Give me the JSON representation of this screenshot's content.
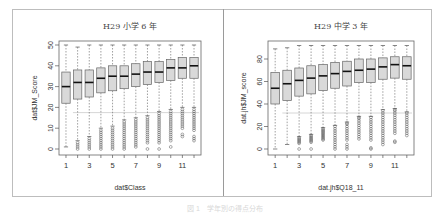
{
  "caption": "図 1　学年別の得点分布",
  "chart_data": [
    {
      "type": "boxplot",
      "title": "H29 小学 6 年",
      "xlabel": "dat$Class",
      "ylabel": "dat$JM_Score",
      "ylim": [
        0,
        50
      ],
      "yticks": [
        0,
        10,
        20,
        30,
        40,
        50
      ],
      "categories": [
        "1",
        "2",
        "3",
        "4",
        "5",
        "6",
        "7",
        "8",
        "9",
        "10",
        "11",
        "12"
      ],
      "xtick_labels": [
        "1",
        "3",
        "5",
        "7",
        "9",
        "11"
      ],
      "reference_line": 17.5,
      "boxes": [
        {
          "whislo": 1,
          "q1": 22,
          "med": 30,
          "q3": 37,
          "whishi": 50,
          "outliers": []
        },
        {
          "whislo": 4,
          "q1": 24,
          "med": 32,
          "q3": 38,
          "whishi": 49,
          "outliers": [
            0,
            1,
            2,
            3
          ]
        },
        {
          "whislo": 6,
          "q1": 25,
          "med": 32,
          "q3": 38,
          "whishi": 50,
          "outliers": [
            0,
            1,
            2,
            3,
            4,
            5
          ]
        },
        {
          "whislo": 10,
          "q1": 27,
          "med": 34,
          "q3": 39,
          "whishi": 50,
          "outliers": [
            0,
            1,
            2,
            3,
            4,
            5,
            6,
            7,
            8,
            9
          ]
        },
        {
          "whislo": 11,
          "q1": 28,
          "med": 35,
          "q3": 40,
          "whishi": 50,
          "outliers": [
            0,
            1,
            2,
            3,
            4,
            5,
            6,
            7,
            8,
            9,
            10
          ]
        },
        {
          "whislo": 14,
          "q1": 29,
          "med": 35,
          "q3": 40,
          "whishi": 50,
          "outliers": [
            0,
            1,
            2,
            3,
            4,
            5,
            6,
            7,
            8,
            9,
            10,
            11,
            12,
            13
          ]
        },
        {
          "whislo": 15,
          "q1": 30,
          "med": 36,
          "q3": 41,
          "whishi": 50,
          "outliers": [
            1,
            2,
            3,
            4,
            5,
            6,
            7,
            8,
            9,
            10,
            11,
            12,
            13,
            14
          ]
        },
        {
          "whislo": 16,
          "q1": 31,
          "med": 37,
          "q3": 42,
          "whishi": 50,
          "outliers": [
            0,
            3,
            4,
            5,
            6,
            7,
            8,
            9,
            10,
            11,
            12,
            13,
            14,
            15
          ]
        },
        {
          "whislo": 18,
          "q1": 32,
          "med": 37,
          "q3": 42,
          "whishi": 50,
          "outliers": [
            0,
            3,
            4,
            5,
            6,
            7,
            8,
            9,
            10,
            11,
            12,
            13,
            14,
            15,
            16,
            17
          ]
        },
        {
          "whislo": 19,
          "q1": 33,
          "med": 39,
          "q3": 43,
          "whishi": 50,
          "outliers": [
            1,
            4,
            5,
            6,
            7,
            8,
            9,
            10,
            11,
            12,
            13,
            14,
            15,
            16,
            17,
            18
          ]
        },
        {
          "whislo": 20,
          "q1": 34,
          "med": 39,
          "q3": 44,
          "whishi": 50,
          "outliers": [
            6,
            7,
            10,
            11,
            12,
            13,
            14,
            15,
            16,
            17,
            18,
            19
          ]
        },
        {
          "whislo": 20,
          "q1": 34,
          "med": 40,
          "q3": 44,
          "whishi": 50,
          "outliers": [
            4,
            5,
            6,
            9,
            10,
            11,
            12,
            13,
            14,
            15,
            16,
            17,
            18,
            19
          ]
        }
      ]
    },
    {
      "type": "boxplot",
      "title": "H29 中学 3 年",
      "xlabel": "dat.jh$Q18_11",
      "ylabel": "dat.jh$JM_score",
      "ylim": [
        0,
        92
      ],
      "yticks": [
        0,
        20,
        40,
        60,
        80
      ],
      "categories": [
        "1",
        "2",
        "3",
        "4",
        "5",
        "6",
        "7",
        "8",
        "9",
        "10",
        "11",
        "12"
      ],
      "xtick_labels": [
        "1",
        "3",
        "5",
        "7",
        "9",
        "11"
      ],
      "reference_line": 32,
      "boxes": [
        {
          "whislo": 0,
          "q1": 40,
          "med": 54,
          "q3": 68,
          "whishi": 89,
          "outliers": []
        },
        {
          "whislo": 4,
          "q1": 43,
          "med": 58,
          "q3": 70,
          "whishi": 90,
          "outliers": []
        },
        {
          "whislo": 11,
          "q1": 47,
          "med": 61,
          "q3": 72,
          "whishi": 92,
          "outliers": [
            0,
            5,
            6,
            7,
            8,
            9,
            10
          ]
        },
        {
          "whislo": 13,
          "q1": 49,
          "med": 63,
          "q3": 74,
          "whishi": 92,
          "outliers": [
            0,
            6,
            7,
            8,
            9,
            10,
            11,
            12
          ]
        },
        {
          "whislo": 19,
          "q1": 52,
          "med": 65,
          "q3": 75,
          "whishi": 92,
          "outliers": [
            8,
            9,
            10,
            11,
            12,
            13,
            14,
            15,
            16,
            17,
            18
          ]
        },
        {
          "whislo": 21,
          "q1": 54,
          "med": 67,
          "q3": 77,
          "whishi": 92,
          "outliers": [
            0,
            2,
            4,
            6,
            8,
            10,
            12,
            14,
            16,
            18,
            20
          ]
        },
        {
          "whislo": 24,
          "q1": 56,
          "med": 69,
          "q3": 78,
          "whishi": 92,
          "outliers": [
            0,
            2,
            4,
            8,
            10,
            12,
            14,
            16,
            18,
            20,
            22,
            23
          ]
        },
        {
          "whislo": 29,
          "q1": 59,
          "med": 70,
          "q3": 80,
          "whishi": 92,
          "outliers": [
            9,
            11,
            13,
            15,
            17,
            19,
            21,
            23,
            25,
            27,
            28
          ]
        },
        {
          "whislo": 29,
          "q1": 59,
          "med": 71,
          "q3": 80,
          "whishi": 92,
          "outliers": [
            0,
            1,
            8,
            10,
            12,
            14,
            16,
            18,
            20,
            22,
            24,
            26,
            28
          ]
        },
        {
          "whislo": 35,
          "q1": 62,
          "med": 73,
          "q3": 81,
          "whishi": 92,
          "outliers": [
            4,
            6,
            8,
            10,
            12,
            14,
            16,
            18,
            20,
            22,
            24,
            26,
            28,
            30,
            32,
            34
          ]
        },
        {
          "whislo": 36,
          "q1": 63,
          "med": 75,
          "q3": 82,
          "whishi": 92,
          "outliers": [
            6,
            7,
            14,
            16,
            18,
            20,
            22,
            24,
            26,
            28,
            30,
            32,
            34,
            35
          ]
        },
        {
          "whislo": 33,
          "q1": 62,
          "med": 74,
          "q3": 82,
          "whishi": 92,
          "outliers": [
            12,
            14,
            16,
            18,
            20,
            22,
            24,
            26,
            28,
            30,
            32
          ]
        }
      ]
    }
  ]
}
